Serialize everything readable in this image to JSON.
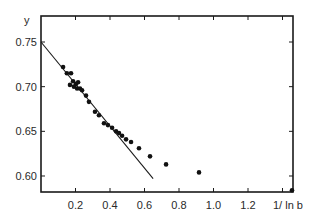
{
  "chart_data": {
    "type": "scatter",
    "title": "",
    "xlabel": "1/ ln b",
    "ylabel": "y",
    "xlim": [
      0,
      1.45
    ],
    "ylim": [
      0.58,
      0.78
    ],
    "grid": false,
    "legend": null,
    "x_ticks": [
      0.2,
      0.4,
      0.6,
      0.8,
      1.0,
      1.2,
      1.4
    ],
    "x_tick_labels": [
      "0.2",
      "0.4",
      "0.6",
      "0.8",
      "1.0",
      "1.2",
      ""
    ],
    "y_ticks": [
      0.6,
      0.65,
      0.7,
      0.75
    ],
    "y_tick_labels": [
      "0.60",
      "0.65",
      "0.70",
      "0.75"
    ],
    "series": [
      {
        "name": "data",
        "kind": "points",
        "x": [
          0.128,
          0.15,
          0.174,
          0.168,
          0.186,
          0.203,
          0.191,
          0.215,
          0.209,
          0.226,
          0.238,
          0.261,
          0.278,
          0.313,
          0.336,
          0.365,
          0.388,
          0.412,
          0.435,
          0.452,
          0.47,
          0.493,
          0.522,
          0.568,
          0.632,
          0.725,
          0.916,
          1.455
        ],
        "y": [
          0.722,
          0.715,
          0.715,
          0.702,
          0.706,
          0.703,
          0.7,
          0.705,
          0.698,
          0.698,
          0.696,
          0.69,
          0.683,
          0.672,
          0.668,
          0.659,
          0.657,
          0.654,
          0.65,
          0.648,
          0.645,
          0.641,
          0.638,
          0.631,
          0.622,
          0.613,
          0.604,
          0.584
        ]
      },
      {
        "name": "linear fit",
        "kind": "line",
        "x": [
          0.0,
          0.65
        ],
        "y": [
          0.75,
          0.597
        ]
      }
    ],
    "colors": {
      "axes": "#1a1a1a",
      "points": "#111111",
      "line": "#1a1a1a",
      "background": "#ffffff"
    }
  }
}
